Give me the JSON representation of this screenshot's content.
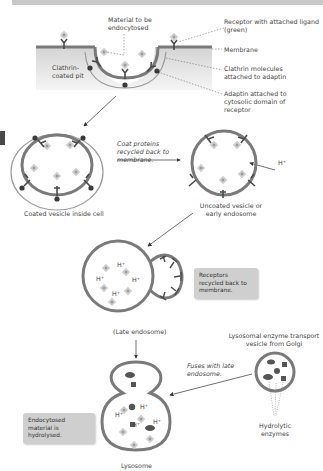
{
  "labels": {
    "material": "Material to be endocytosed",
    "receptor": "Receptor with attached ligand (green)",
    "membrane": "Membrane",
    "clathrin_molecules": "Clathrin molecules attached to adaptin",
    "adaptin": "Adaptin attached to cytosolic domain of receptor",
    "clathrin_pit": "Clathrin-coated pit",
    "coated_vesicle": "Coated vesicle inside cell",
    "coat_recycled": "Coat proteins recycled back to membrane.",
    "uncoated_vesicle": "Uncoated vesicle or early endosome",
    "h_plus": "H⁺",
    "receptors_recycled": "Receptors recycled back to membrane.",
    "late_endosome": "(Late endosome)",
    "transport_vesicle": "Lysosomal enzyme transport vesicle from Golgi",
    "fuses": "Fuses with late endosome.",
    "hydrolytic": "Hydrolytic enzymes",
    "hydrolysed": "Endocytosed material is hydrolysed.",
    "lysosome": "Lysosome"
  },
  "colors": {
    "membrane": "#8a8a8a",
    "cytosol": "#d9d9d9",
    "receptor": "#4a4a4a",
    "ligand": "#c8c8c8",
    "note_bg": "#cfcfcf"
  }
}
